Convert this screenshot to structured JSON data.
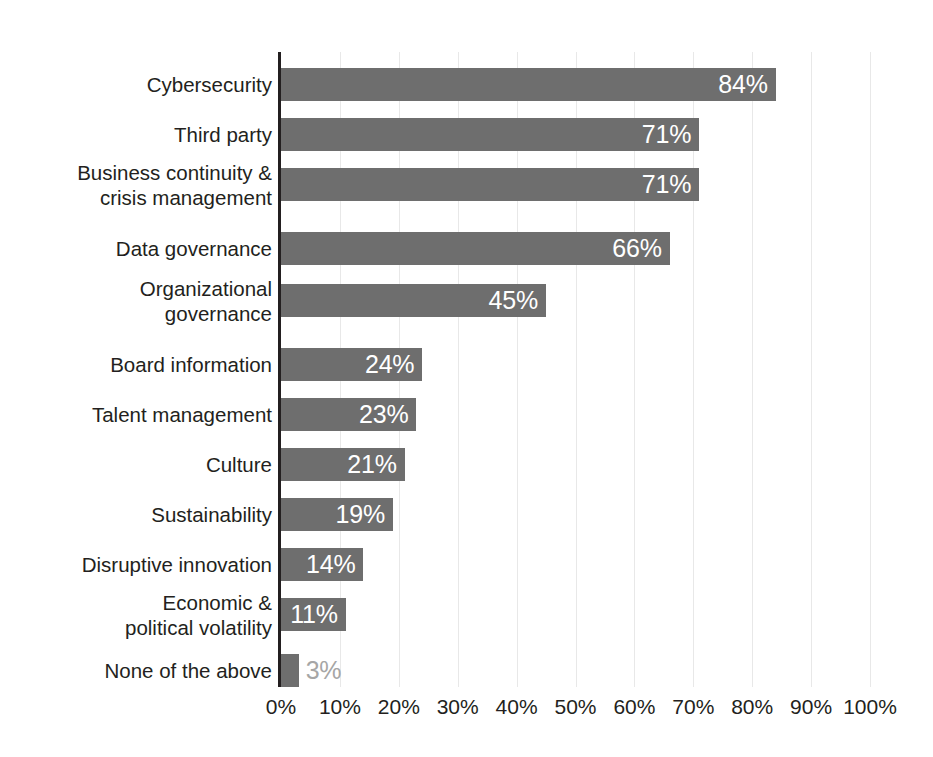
{
  "chart_data": {
    "type": "bar",
    "orientation": "horizontal",
    "title": "",
    "subtitle": "",
    "xlabel": "",
    "ylabel": "",
    "xlim": [
      0,
      100
    ],
    "x_tick_labels": [
      "0%",
      "10%",
      "20%",
      "30%",
      "40%",
      "50%",
      "60%",
      "70%",
      "80%",
      "90%",
      "100%"
    ],
    "x_ticks": [
      0,
      10,
      20,
      30,
      40,
      50,
      60,
      70,
      80,
      90,
      100
    ],
    "grid": "vertical-only",
    "legend": "none",
    "value_label_suffix": "%",
    "categories": [
      "Cybersecurity",
      "Third party",
      "Business continuity &\ncrisis management",
      "Data governance",
      "Organizational\ngovernance",
      "Board information",
      "Talent management",
      "Culture",
      "Sustainability",
      "Disruptive innovation",
      "Economic &\npolitical volatility",
      "None of the above"
    ],
    "values": [
      84,
      71,
      71,
      66,
      45,
      24,
      23,
      21,
      19,
      14,
      11,
      3
    ],
    "value_labels": [
      "84%",
      "71%",
      "71%",
      "66%",
      "45%",
      "24%",
      "23%",
      "21%",
      "19%",
      "14%",
      "11%",
      "3%"
    ],
    "label_placement": [
      "inside",
      "inside",
      "inside",
      "inside",
      "inside",
      "inside",
      "inside",
      "inside",
      "inside",
      "inside",
      "inside",
      "outside"
    ],
    "bar_tops": [
      16,
      66,
      116,
      180,
      232,
      296,
      346,
      396,
      446,
      496,
      546,
      602
    ],
    "group_break_after_index": 4,
    "colors": {
      "bar": "#6e6e6e",
      "label_inside": "#ffffff",
      "label_outside": "#a6a6a6",
      "axis": "#231f20",
      "gridline": "#e8e8e8",
      "background": "#ffffff",
      "text": "#231f20"
    }
  }
}
